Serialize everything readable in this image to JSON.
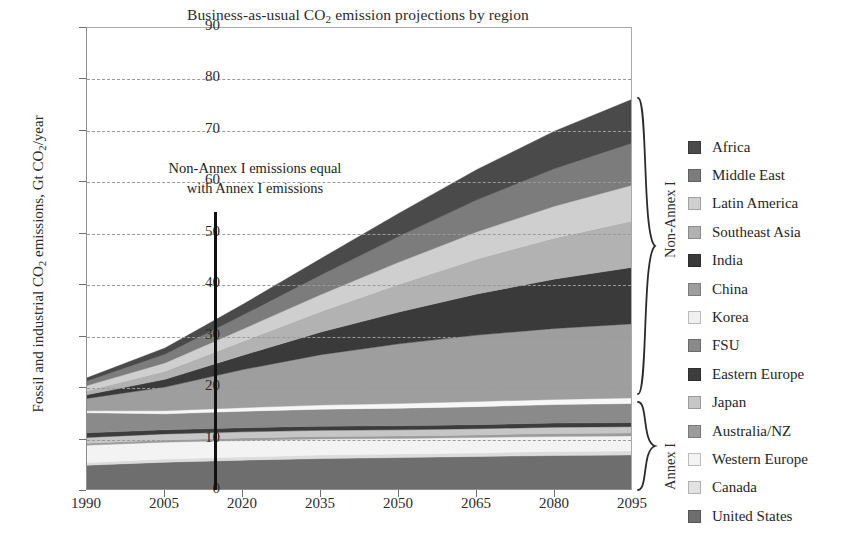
{
  "chart_data": {
    "type": "area",
    "stacked": true,
    "title": "Business-as-usual CO2 emission projections by region",
    "title_parts": {
      "pre": "Business-as-usual CO",
      "sub": "2",
      "post": " emission projections by region"
    },
    "xlabel": "",
    "ylabel": "Fossil and industrial CO2 emissions, Gt CO2/year",
    "ylabel_parts": {
      "a": "Fossil and industrial CO",
      "sub1": "2",
      "b": " emissions, Gt CO",
      "sub2": "2",
      "c": "/year"
    },
    "xlim": [
      1990,
      2095
    ],
    "ylim": [
      0,
      90
    ],
    "xticks": [
      1990,
      2005,
      2020,
      2035,
      2050,
      2065,
      2080,
      2095
    ],
    "yticks": [
      0,
      10,
      20,
      30,
      40,
      50,
      60,
      70,
      80,
      90
    ],
    "grid": "horizontal-dashed",
    "legend_position": "right",
    "x": [
      1990,
      2005,
      2020,
      2035,
      2050,
      2065,
      2080,
      2095
    ],
    "series": [
      {
        "name": "United States",
        "color": "#6e6e6e",
        "group": "Annex I",
        "values": [
          5.0,
          5.6,
          6.0,
          6.3,
          6.5,
          6.7,
          6.9,
          7.0
        ]
      },
      {
        "name": "Canada",
        "color": "#dcdcdc",
        "group": "Annex I",
        "values": [
          0.5,
          0.6,
          0.6,
          0.7,
          0.7,
          0.7,
          0.8,
          0.8
        ]
      },
      {
        "name": "Western Europe",
        "color": "#f3f3f3",
        "group": "Annex I",
        "values": [
          3.4,
          3.3,
          3.2,
          3.1,
          3.0,
          3.0,
          2.9,
          2.9
        ]
      },
      {
        "name": "Australia/NZ",
        "color": "#9c9c9c",
        "group": "Annex I",
        "values": [
          0.4,
          0.4,
          0.5,
          0.5,
          0.5,
          0.5,
          0.6,
          0.6
        ]
      },
      {
        "name": "Japan",
        "color": "#c6c6c6",
        "group": "Annex I",
        "values": [
          1.1,
          1.2,
          1.2,
          1.2,
          1.2,
          1.2,
          1.2,
          1.2
        ]
      },
      {
        "name": "Eastern Europe",
        "color": "#3c3c3c",
        "group": "Annex I",
        "values": [
          0.9,
          0.8,
          0.8,
          0.8,
          0.8,
          0.8,
          0.8,
          0.8
        ]
      },
      {
        "name": "FSU",
        "color": "#8a8a8a",
        "group": "Annex I",
        "values": [
          3.9,
          3.1,
          3.2,
          3.3,
          3.4,
          3.5,
          3.6,
          3.7
        ]
      },
      {
        "name": "Korea",
        "color": "#f7f7f7",
        "group": "Non-Annex I",
        "values": [
          0.4,
          0.6,
          0.7,
          0.8,
          0.9,
          1.0,
          1.0,
          1.1
        ]
      },
      {
        "name": "China",
        "color": "#9e9e9e",
        "group": "Non-Annex I",
        "values": [
          2.4,
          4.6,
          7.4,
          9.8,
          11.6,
          12.9,
          13.8,
          14.4
        ]
      },
      {
        "name": "India",
        "color": "#3a3a3a",
        "group": "Non-Annex I",
        "values": [
          0.7,
          1.5,
          2.8,
          4.4,
          6.2,
          8.0,
          9.6,
          11.0
        ]
      },
      {
        "name": "Southeast Asia",
        "color": "#b2b2b2",
        "group": "Non-Annex I",
        "values": [
          0.8,
          1.6,
          2.7,
          4.0,
          5.4,
          6.8,
          8.0,
          9.0
        ]
      },
      {
        "name": "Latin America",
        "color": "#cfcfcf",
        "group": "Non-Annex I",
        "values": [
          1.0,
          1.6,
          2.4,
          3.3,
          4.3,
          5.3,
          6.2,
          7.0
        ]
      },
      {
        "name": "Middle East",
        "color": "#7c7c7c",
        "group": "Non-Annex I",
        "values": [
          0.9,
          1.7,
          2.7,
          3.8,
          5.0,
          6.2,
          7.3,
          8.2
        ]
      },
      {
        "name": "Africa",
        "color": "#4a4a4a",
        "group": "Non-Annex I",
        "values": [
          0.6,
          1.2,
          2.1,
          3.2,
          4.5,
          5.9,
          7.3,
          8.5
        ]
      }
    ],
    "stack_order_bottom_to_top": [
      "United States",
      "Canada",
      "Western Europe",
      "Australia/NZ",
      "Japan",
      "Eastern Europe",
      "FSU",
      "Korea",
      "China",
      "India",
      "Southeast Asia",
      "Latin America",
      "Middle East",
      "Africa"
    ],
    "totals": [
      22.0,
      27.8,
      36.3,
      45.2,
      54.0,
      62.5,
      70.0,
      76.2
    ],
    "annotation": {
      "text_line1": "Non-Annex I emissions equal",
      "text_line2": "with Annex I emissions",
      "marker_year": 2016,
      "marker_top_value": 55
    },
    "groups": [
      {
        "label": "Non-Annex I",
        "span_values": [
          21.0,
          79.0
        ]
      },
      {
        "label": "Annex I",
        "span_values": [
          0,
          21.0
        ]
      }
    ]
  },
  "legend": {
    "items": [
      {
        "label": "Africa",
        "color": "#4a4a4a"
      },
      {
        "label": "Middle East",
        "color": "#7c7c7c"
      },
      {
        "label": "Latin America",
        "color": "#cfcfcf"
      },
      {
        "label": "Southeast Asia",
        "color": "#b2b2b2"
      },
      {
        "label": "India",
        "color": "#3a3a3a"
      },
      {
        "label": "China",
        "color": "#9e9e9e"
      },
      {
        "label": "Korea",
        "color": "#f0f0f0"
      },
      {
        "label": "FSU",
        "color": "#8a8a8a"
      },
      {
        "label": "Eastern Europe",
        "color": "#3c3c3c"
      },
      {
        "label": "Japan",
        "color": "#c6c6c6"
      },
      {
        "label": "Australia/NZ",
        "color": "#9c9c9c"
      },
      {
        "label": "Western Europe",
        "color": "#f3f3f3"
      },
      {
        "label": "Canada",
        "color": "#e2e2e2"
      },
      {
        "label": "United States",
        "color": "#6e6e6e"
      }
    ]
  }
}
